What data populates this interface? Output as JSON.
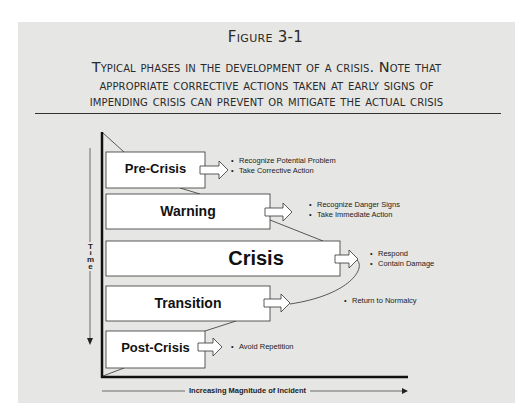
{
  "figure": {
    "title": "Figure 3-1",
    "caption_lines": [
      "Typical phases in the development of a crisis. Note that",
      "appropriate corrective actions taken at early signs of",
      "impending crisis can prevent or mitigate the actual crisis"
    ]
  },
  "axes": {
    "y_label_letters": [
      "T",
      "i",
      "m",
      "e"
    ],
    "y_label": "Time",
    "x_label": "Increasing Magnitude of Incident"
  },
  "phases": [
    {
      "label": "Pre-Crisis",
      "actions": [
        "Recognize Potential Problem",
        "Take Corrective Action"
      ]
    },
    {
      "label": "Warning",
      "actions": [
        "Recognize Danger Signs",
        "Take Immediate Action"
      ]
    },
    {
      "label": "Crisis",
      "actions": [
        "Respond",
        "Contain Damage"
      ]
    },
    {
      "label": "Transition",
      "actions": [
        "Return to Normalcy"
      ]
    },
    {
      "label": "Post-Crisis",
      "actions": [
        "Avoid Repetition"
      ]
    }
  ],
  "colors": {
    "panel_background": "#e6e6e4",
    "box_fill": "#ffffff",
    "line": "#1a1a1a"
  }
}
